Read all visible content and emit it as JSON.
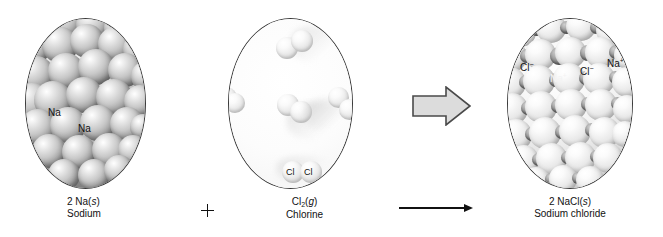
{
  "figure": {
    "type": "chemical-reaction-diagram"
  },
  "reactants": [
    {
      "id": "sodium",
      "formula_line": "2 Na(s)",
      "formula_prefix": "2 Na(",
      "state": "s",
      "formula_suffix": ")",
      "name": "Sodium",
      "phase": "solid",
      "coefficient": "2",
      "particle_labels": [
        "Na",
        "Na"
      ],
      "depiction": "close-packed metallic spheres",
      "sphere_color": "#b0b0b0"
    },
    {
      "id": "chlorine",
      "formula_prefix": "Cl",
      "subscript": "2",
      "formula_mid": "(",
      "state": "g",
      "formula_suffix": ")",
      "name": "Chlorine",
      "phase": "gas",
      "particle_labels": [
        "Cl",
        "Cl"
      ],
      "depiction": "diatomic molecules dispersed in gas",
      "sphere_color": "#e2e2e2"
    }
  ],
  "products": [
    {
      "id": "sodium-chloride",
      "formula_prefix": "2 NaCl(",
      "state": "s",
      "formula_suffix": ")",
      "name": "Sodium chloride",
      "phase": "solid",
      "coefficient": "2",
      "ion_labels": [
        {
          "text": "Cl",
          "charge": "−"
        },
        {
          "text": "Na",
          "charge": "+"
        },
        {
          "text": "Cl",
          "charge": "−"
        },
        {
          "text": "Na",
          "charge": "+"
        }
      ],
      "depiction": "ionic cubic lattice",
      "anion_color": "#e8e8e8",
      "cation_color": "#7d7d7d"
    }
  ],
  "operators": {
    "plus": "+",
    "yields_arrow": "→",
    "transform_arrow": "block-arrow-right"
  },
  "colors": {
    "background": "#ffffff",
    "outline": "#3a3a3a",
    "text": "#111111",
    "block_arrow_fill": "#dcdcdc",
    "block_arrow_stroke": "#4a4a4a"
  }
}
